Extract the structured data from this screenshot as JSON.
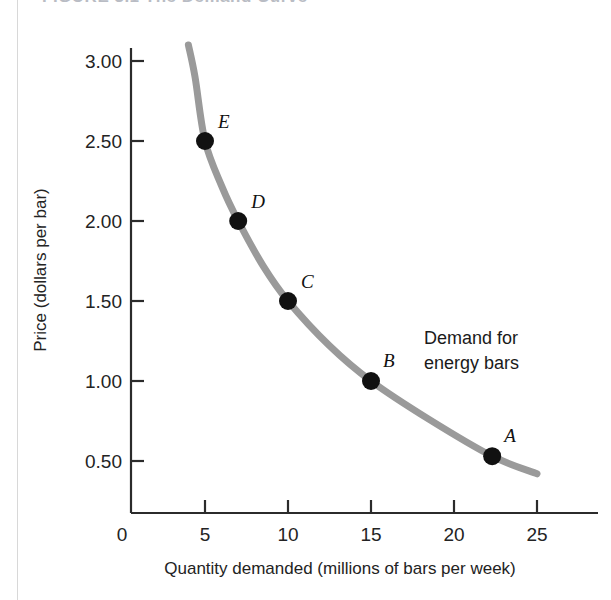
{
  "figure": {
    "title": "FIGURE 3.1   The Demand Curve",
    "title_visible_fragment": "FIGURE 3.1   The Demand Curve"
  },
  "chart_data": {
    "type": "line",
    "title": "FIGURE 3.1   The Demand Curve",
    "xlabel": "Quantity demanded (millions of bars per week)",
    "ylabel": "Price (dollars per bar)",
    "xlim": [
      0,
      26.5
    ],
    "ylim": [
      0,
      3.3
    ],
    "xticks": [
      0,
      5,
      10,
      15,
      20,
      25
    ],
    "xtick_labels": [
      "0",
      "5",
      "10",
      "15",
      "20",
      "25"
    ],
    "yticks": [
      0.5,
      1.0,
      1.5,
      2.0,
      2.5,
      3.0
    ],
    "ytick_labels": [
      "0.50",
      "1.00",
      "1.50",
      "2.00",
      "2.50",
      "3.00"
    ],
    "grid": false,
    "legend": false,
    "series": [
      {
        "name": "Demand for energy bars",
        "color": "#9a9a9a",
        "line_width": 7,
        "x": [
          4.0,
          4.4,
          5.0,
          6.0,
          7.0,
          8.5,
          10.0,
          12.5,
          15.0,
          18.5,
          22.3,
          25.0
        ],
        "y": [
          3.1,
          2.9,
          2.5,
          2.22,
          2.0,
          1.72,
          1.5,
          1.22,
          1.0,
          0.76,
          0.53,
          0.42
        ]
      }
    ],
    "points": [
      {
        "label": "A",
        "x": 22.3,
        "y": 0.53,
        "label_dx": 12,
        "label_dy": -14
      },
      {
        "label": "B",
        "x": 15.0,
        "y": 1.0,
        "label_dx": 12,
        "label_dy": -14
      },
      {
        "label": "C",
        "x": 10.0,
        "y": 1.5,
        "label_dx": 13,
        "label_dy": -13
      },
      {
        "label": "D",
        "x": 7.0,
        "y": 2.0,
        "label_dx": 13,
        "label_dy": -13
      },
      {
        "label": "E",
        "x": 5.0,
        "y": 2.5,
        "label_dx": 13,
        "label_dy": -13
      }
    ],
    "annotations": [
      {
        "text_line_1": "Demand for",
        "text_line_2": "energy bars",
        "x": 17.2,
        "y": 1.12
      }
    ],
    "marker_color": "#111111",
    "marker_radius": 9,
    "axis_color": "#2b2b2b"
  },
  "annotation": {
    "line1": "Demand for",
    "line2": "energy bars"
  },
  "axes": {
    "y_title": "Price (dollars per bar)",
    "x_title": "Quantity demanded (millions of bars per week)",
    "y_labels": [
      "3.00",
      "2.50",
      "2.00",
      "1.50",
      "1.00",
      "0.50"
    ],
    "x_labels": [
      "0",
      "5",
      "10",
      "15",
      "20",
      "25"
    ]
  },
  "point_labels": {
    "a": "A",
    "b": "B",
    "c": "C",
    "d": "D",
    "e": "E"
  }
}
